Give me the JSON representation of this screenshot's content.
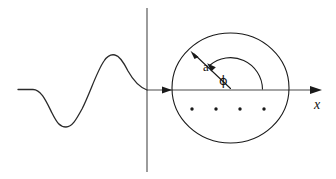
{
  "figure": {
    "background_color": "#ffffff",
    "ink_color": "#1a1a1a",
    "axis_color": "#4a4a4a",
    "width": 336,
    "height": 179
  },
  "labels": {
    "radius": "a",
    "angle": "ϕ",
    "axis_x": "x"
  },
  "axes": {
    "x_axis": {
      "name": "x-axis",
      "y": 90,
      "x_start": 147,
      "x_end": 322,
      "arrow_at_start": true,
      "arrow_at_end": true,
      "label": "x",
      "label_x": 314,
      "label_y": 101
    },
    "y_axis": {
      "name": "vertical-axis",
      "x": 147,
      "y_top": 8,
      "y_bottom": 172,
      "label": ""
    }
  },
  "wave": {
    "name": "incident-wave-packet",
    "description": "flat line, trough, crest, descending to origin",
    "baseline_y": 90,
    "flat_start_x": 18,
    "flat_end_x": 33,
    "trough": {
      "x": 65,
      "y": 127
    },
    "crest": {
      "x": 113,
      "y": 55
    },
    "end": {
      "x": 147,
      "y": 90
    }
  },
  "scatterer": {
    "name": "circular-region",
    "center": {
      "x": 230.5,
      "y": 88
    },
    "radius_x": 58.5,
    "radius_y": 55
  },
  "radius_arrow": {
    "name": "radius-a-arrow",
    "from": {
      "x": 230.5,
      "y": 88
    },
    "tip": {
      "x": 191,
      "y": 51
    },
    "label": "a",
    "label_x": 203,
    "label_y": 61
  },
  "angle_arc": {
    "name": "phi-angle-arc",
    "center": {
      "x": 230.5,
      "y": 89
    },
    "radius": 32,
    "start_angle_deg": 0,
    "end_angle_deg": 136,
    "label": "ϕ",
    "label_x": 221,
    "label_y": 76
  },
  "lattice_dots": {
    "name": "lattice-points",
    "count": 4,
    "y": 109,
    "x_positions": [
      192,
      216,
      240,
      264
    ],
    "radius": 1.7
  }
}
